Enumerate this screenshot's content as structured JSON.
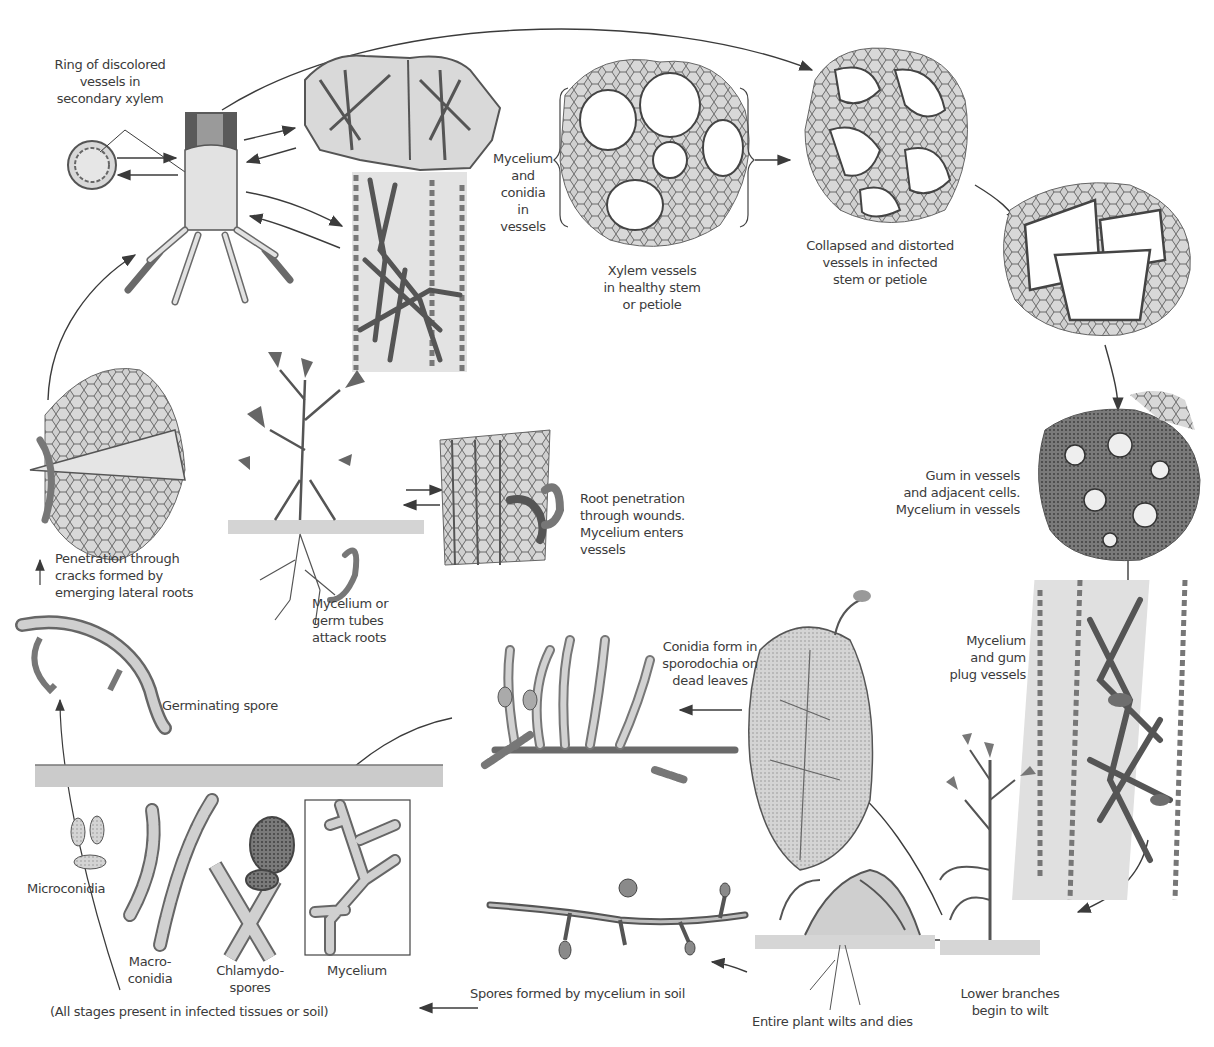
{
  "diagram": {
    "type": "disease-cycle",
    "palette": {
      "ink": "#3b3b3b",
      "fill_light": "#d9d9d9",
      "fill_mid": "#b5b5b5",
      "fill_dark": "#6e6e6e",
      "soil": "#c8c8c8",
      "background": "#ffffff"
    },
    "labels": {
      "ring_discolored": "Ring of discolored\nvessels in\nsecondary xylem",
      "mycelium_conidia_vessels": "Mycelium\nand\nconidia\nin\nvessels",
      "xylem_healthy": "Xylem vessels\nin healthy stem\nor petiole",
      "collapsed_distorted": "Collapsed and distorted\nvessels in infected\nstem or petiole",
      "gum_in_vessels": "Gum in vessels\nand adjacent cells.\nMycelium in vessels",
      "root_penetration": "Root penetration\nthrough wounds.\nMycelium enters\nvessels",
      "penetration_cracks": "Penetration through\ncracks formed by\nemerging lateral roots",
      "mycelium_germ_tubes": "Mycelium or\ngerm tubes\nattack roots",
      "germinating_spore": "Germinating spore",
      "conidia_sporodochia": "Conidia form in\nsporodochia on\ndead leaves",
      "mycelium_gum_plug": "Mycelium\nand gum\nplug vessels",
      "microconidia": "Microconidia",
      "macroconidia": "Macro-\nconidia",
      "chlamydospores": "Chlamydo-\nspores",
      "mycelium": "Mycelium",
      "all_stages": "(All stages present in infected tissues or soil)",
      "spores_formed_soil": "Spores formed by mycelium in soil",
      "entire_plant_wilts": "Entire plant wilts and dies",
      "lower_branches_wilt": "Lower branches\nbegin to wilt"
    },
    "stages": [
      {
        "id": "spores-in-soil",
        "label_key": "all_stages"
      },
      {
        "id": "germinating-spore",
        "label_key": "germinating_spore"
      },
      {
        "id": "root-penetration",
        "label_key": "penetration_cracks"
      },
      {
        "id": "root-attack",
        "label_key": "mycelium_germ_tubes"
      },
      {
        "id": "wound-entry",
        "label_key": "root_penetration"
      },
      {
        "id": "stem-infection",
        "label_key": "ring_discolored"
      },
      {
        "id": "vessel-colonization",
        "label_key": "mycelium_conidia_vessels"
      },
      {
        "id": "healthy-xylem",
        "label_key": "xylem_healthy"
      },
      {
        "id": "collapsed-vessels",
        "label_key": "collapsed_distorted"
      },
      {
        "id": "gum-vessels",
        "label_key": "gum_in_vessels"
      },
      {
        "id": "plugged-vessels",
        "label_key": "mycelium_gum_plug"
      },
      {
        "id": "lower-wilt",
        "label_key": "lower_branches_wilt"
      },
      {
        "id": "plant-dies",
        "label_key": "entire_plant_wilts"
      },
      {
        "id": "sporodochia",
        "label_key": "conidia_sporodochia"
      },
      {
        "id": "soil-spores",
        "label_key": "spores_formed_soil"
      }
    ]
  }
}
